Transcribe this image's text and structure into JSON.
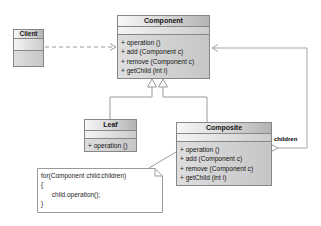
{
  "diagram_title": "Composite design pattern class diagram",
  "colors": {
    "box_border": "#878787",
    "title_gradient_start": "#f7f7f7",
    "title_gradient_end": "#b3b3b3",
    "body_fill": "#cfcfcf",
    "connector_line": "#9a9a9a",
    "note_fill": "#ffffff"
  },
  "classes": {
    "client": {
      "name": "Client"
    },
    "component": {
      "name": "Component",
      "methods": [
        "+ operation ()",
        "+ add (Component c)",
        "+ remove (Component c)",
        "+ getChild (int i)"
      ]
    },
    "leaf": {
      "name": "Leaf",
      "methods": [
        "+ operation ()"
      ]
    },
    "composite": {
      "name": "Composite",
      "methods": [
        "+ operation ()",
        "+ add (Component c)",
        "+ remove (Component c)",
        "+ getChild (int i)"
      ]
    }
  },
  "note": {
    "lines": [
      "for(Component child:children)",
      "{",
      "      child.operation();",
      "}"
    ]
  },
  "labels": {
    "children": "children"
  }
}
